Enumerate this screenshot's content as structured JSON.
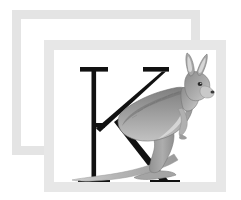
{
  "artwork": {
    "title": "K is for Kangaroo",
    "letter": "K",
    "subject": "kangaroo",
    "style": "serif capital letter with grayscale kangaroo illustration",
    "alt_text": "Capital letter K with a kangaroo standing in front of it, inside two stacked picture frames"
  },
  "frames": {
    "back": {
      "name": "back-frame",
      "color": "#e4e4e4",
      "border_width_px": 9,
      "x": 12,
      "y": 10,
      "width": 188,
      "height": 145
    },
    "front": {
      "name": "front-frame",
      "color": "#e7e7e7",
      "border_width_px": 10,
      "mat_color": "#ffffff",
      "x": 44,
      "y": 40,
      "width": 182,
      "height": 152
    }
  },
  "letter_glyph": {
    "character": "K",
    "color": "#111111",
    "typeface_style": "serif",
    "stroke_color": "#111111"
  },
  "kangaroo": {
    "label": "kangaroo",
    "body_color": "#9a9a9a",
    "back_color": "#7a7a7a",
    "belly_color": "#cfcfcf",
    "outline_color": "#6d6d6d",
    "tail_color": "#b3b3b3",
    "eye_color": "#2b2b2b",
    "nose_color": "#3a3a3a",
    "parts": [
      "ears",
      "head",
      "muzzle",
      "neck",
      "torso",
      "foreleg",
      "hind-leg",
      "foot",
      "tail"
    ]
  },
  "palette": {
    "background": "#ffffff",
    "frame_light": "#e7e7e7",
    "frame_back": "#e4e4e4",
    "ink": "#111111"
  }
}
